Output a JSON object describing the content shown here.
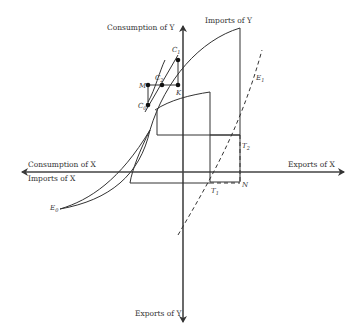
{
  "diagram": {
    "axes": {
      "y_up_label": "Consumption of Y",
      "y_up_sub_label": "Imports of Y",
      "y_down_label": "Exports of Y",
      "x_left_top_label": "Consumption of X",
      "x_left_bottom_label": "Imports of X",
      "x_right_label": "Exports of X"
    },
    "points": {
      "C1": {
        "name": "C",
        "sub": "1"
      },
      "C2": {
        "name": "C",
        "sub": "2"
      },
      "C0": {
        "name": "C",
        "sub": "0"
      },
      "M": {
        "name": "M",
        "sub": ""
      },
      "K": {
        "name": "K",
        "sub": ""
      },
      "T1": {
        "name": "T",
        "sub": "1"
      },
      "T2": {
        "name": "T",
        "sub": "2"
      },
      "N": {
        "name": "N",
        "sub": ""
      },
      "E0": {
        "name": "E",
        "sub": "0"
      },
      "E1": {
        "name": "E",
        "sub": "1"
      }
    }
  }
}
